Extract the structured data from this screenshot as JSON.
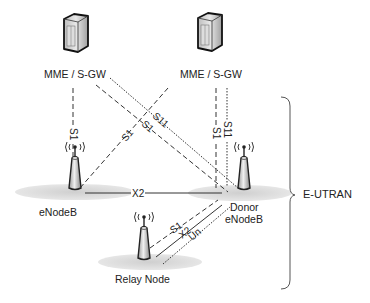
{
  "nodes": {
    "mme_left": {
      "label": "MME / S-GW"
    },
    "mme_right": {
      "label": "MME / S-GW"
    },
    "enodeb": {
      "label": "eNodeB"
    },
    "donor_enodeb": {
      "label_line1": "Donor",
      "label_line2": "eNodeB"
    },
    "relay_node": {
      "label": "Relay Node"
    }
  },
  "group": {
    "label": "E-UTRAN"
  },
  "links": [
    {
      "from": "mme_left",
      "to": "enodeb",
      "label": "S1",
      "style": "dashed"
    },
    {
      "from": "mme_left",
      "to": "donor_enodeb",
      "label": "S1",
      "style": "dashed"
    },
    {
      "from": "mme_left",
      "to": "donor_enodeb",
      "label": "S11",
      "style": "dotted"
    },
    {
      "from": "mme_right",
      "to": "enodeb",
      "label": "S1",
      "style": "dashed"
    },
    {
      "from": "mme_right",
      "to": "donor_enodeb",
      "label": "S1",
      "style": "dashed"
    },
    {
      "from": "mme_right",
      "to": "donor_enodeb",
      "label": "S11",
      "style": "dotted"
    },
    {
      "from": "enodeb",
      "to": "donor_enodeb",
      "label": "X2",
      "style": "solid"
    },
    {
      "from": "relay_node",
      "to": "donor_enodeb",
      "label": "S1",
      "style": "dashed"
    },
    {
      "from": "relay_node",
      "to": "donor_enodeb",
      "label": "X2",
      "style": "solid"
    },
    {
      "from": "relay_node",
      "to": "donor_enodeb",
      "label": "Un",
      "style": "dotted"
    }
  ],
  "link_labels": {
    "s1_left_vertical": "S1",
    "s1_cross_a": "S1",
    "s1_cross_b": "S1",
    "s11_cross": "S11",
    "s1_right_vertical": "S1",
    "s11_right_vertical": "S11",
    "x2_horizontal": "X2",
    "s1_relay": "S1",
    "x2_relay": "X2",
    "un_relay": "Un"
  }
}
